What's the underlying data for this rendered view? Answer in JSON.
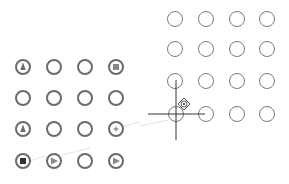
{
  "canvas": {
    "background": "#ffffff",
    "label": "Pattern grid editor"
  },
  "left_grid": {
    "label": "Source pattern grid",
    "stroke": "#6b6b6b",
    "rows": [
      [
        {
          "id": "L-1-1",
          "glyph": "triangle"
        },
        {
          "id": "L-1-2",
          "glyph": "none"
        },
        {
          "id": "L-1-3",
          "glyph": "none"
        },
        {
          "id": "L-1-4",
          "glyph": "square"
        }
      ],
      [
        {
          "id": "L-2-1",
          "glyph": "none"
        },
        {
          "id": "L-2-2",
          "glyph": "none"
        },
        {
          "id": "L-2-3",
          "glyph": "none"
        },
        {
          "id": "L-2-4",
          "glyph": "none"
        }
      ],
      [
        {
          "id": "L-3-1",
          "glyph": "triangle"
        },
        {
          "id": "L-3-2",
          "glyph": "none"
        },
        {
          "id": "L-3-3",
          "glyph": "none"
        },
        {
          "id": "L-3-4",
          "glyph": "plus"
        }
      ],
      [
        {
          "id": "L-4-1",
          "glyph": "square-dark"
        },
        {
          "id": "L-4-2",
          "glyph": "play"
        },
        {
          "id": "L-4-3",
          "glyph": "none"
        },
        {
          "id": "L-4-4",
          "glyph": "play"
        }
      ]
    ]
  },
  "right_grid": {
    "label": "Target pattern grid",
    "stroke": "#7a7a7a",
    "rows": [
      [
        {
          "id": "R-1-1"
        },
        {
          "id": "R-1-2"
        },
        {
          "id": "R-1-3"
        },
        {
          "id": "R-1-4"
        }
      ],
      [
        {
          "id": "R-2-1"
        },
        {
          "id": "R-2-2"
        },
        {
          "id": "R-2-3"
        },
        {
          "id": "R-2-4"
        }
      ],
      [
        {
          "id": "R-3-1"
        },
        {
          "id": "R-3-2"
        },
        {
          "id": "R-3-3"
        },
        {
          "id": "R-3-4"
        }
      ],
      [
        {
          "id": "R-4-1"
        },
        {
          "id": "R-4-2"
        },
        {
          "id": "R-4-3"
        },
        {
          "id": "R-4-4"
        }
      ]
    ]
  },
  "cursor": {
    "type": "crosshair",
    "x": 176,
    "y": 114,
    "color": "#333333",
    "marker": "drag-node-icon"
  }
}
